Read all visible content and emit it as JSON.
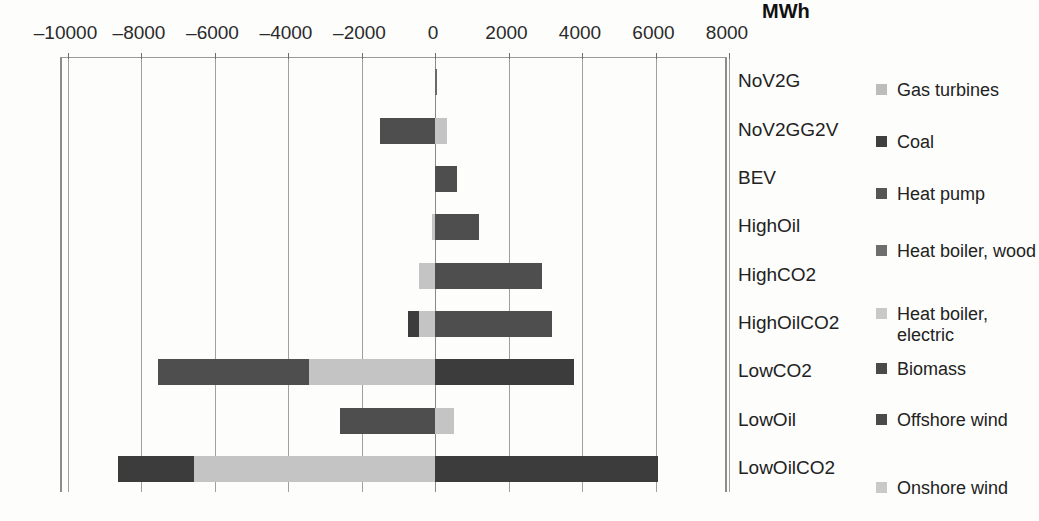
{
  "chart_data": {
    "type": "bar",
    "orientation": "horizontal",
    "stacked": true,
    "title": "",
    "xlabel": "MWh",
    "ylabel": "",
    "unit": "MWh",
    "xlim": [
      -11000,
      9000
    ],
    "xticks": [
      -10000,
      -8000,
      -6000,
      -4000,
      -2000,
      0,
      2000,
      4000,
      6000,
      8000
    ],
    "xtick_labels": [
      "–10000",
      "–8000",
      "–6000",
      "–4000",
      "–2000",
      "0",
      "2000",
      "4000",
      "6000",
      "8000"
    ],
    "grid": true,
    "legend_position": "right",
    "categories": [
      "NoV2G",
      "NoV2GG2V",
      "BEV",
      "HighOil",
      "HighCO2",
      "HighOilCO2",
      "LowCO2",
      "LowOil",
      "LowOilCO2"
    ],
    "series": [
      {
        "name": "Gas turbines",
        "color": "#bdbdbd",
        "values": [
          0,
          0,
          0,
          0,
          0,
          0,
          0,
          0,
          0
        ]
      },
      {
        "name": "Coal",
        "color": "#3f3f3f",
        "values": [
          0,
          0,
          0,
          0,
          0,
          -350,
          0,
          0,
          -2050
        ]
      },
      {
        "name": "Heat pump",
        "color": "#565656",
        "values": [
          0,
          -1500,
          0,
          0,
          0,
          0,
          -4150,
          -2600,
          0
        ]
      },
      {
        "name": "Heat boiler, wood",
        "color": "#6e6e6e",
        "values": [
          0,
          0,
          0,
          0,
          0,
          0,
          0,
          0,
          0
        ]
      },
      {
        "name": "Heat boiler, electric",
        "color": "#c9c9c9",
        "values": [
          0,
          0,
          0,
          0,
          -450,
          -450,
          -3450,
          0,
          -6550
        ]
      },
      {
        "name": "Biomass",
        "color": "#4a4a4a",
        "values": [
          0,
          0,
          0,
          0,
          0,
          0,
          0,
          0,
          0
        ]
      },
      {
        "name": "Offshore wind",
        "color": "#4a4a4a",
        "values": [
          50,
          0,
          600,
          1200,
          2900,
          3200,
          3800,
          0,
          6100
        ]
      },
      {
        "name": "Onshore wind",
        "color": "#c9c9c9",
        "values": [
          0,
          320,
          0,
          0,
          0,
          0,
          0,
          500,
          0
        ]
      }
    ],
    "legend_entries": [
      {
        "label": "Gas turbines",
        "color": "#bdbdbd"
      },
      {
        "label": "Coal",
        "color": "#3f3f3f"
      },
      {
        "label": "Heat pump",
        "color": "#565656"
      },
      {
        "label": "Heat boiler, wood",
        "color": "#6e6e6e"
      },
      {
        "label": "Heat boiler, electric",
        "color": "#c9c9c9"
      },
      {
        "label": "Biomass",
        "color": "#4a4a4a"
      },
      {
        "label": "Offshore wind",
        "color": "#4a4a4a"
      },
      {
        "label": "Onshore wind",
        "color": "#c9c9c9"
      }
    ],
    "bar_segments": [
      {
        "category": "NoV2G",
        "segments": [
          {
            "series": "Offshore wind",
            "from": 0,
            "to": 60,
            "color": "#6a6a6a"
          }
        ]
      },
      {
        "category": "NoV2GG2V",
        "segments": [
          {
            "series": "Heat pump",
            "from": -1500,
            "to": 0,
            "color": "#4e4e4e"
          },
          {
            "series": "Onshore wind",
            "from": 0,
            "to": 330,
            "color": "#c4c4c4"
          }
        ]
      },
      {
        "category": "BEV",
        "segments": [
          {
            "series": "Offshore wind",
            "from": 0,
            "to": 610,
            "color": "#4e4e4e"
          }
        ]
      },
      {
        "category": "HighOil",
        "segments": [
          {
            "series": "Heat boiler, electric",
            "from": -90,
            "to": 0,
            "color": "#c4c4c4"
          },
          {
            "series": "Offshore wind",
            "from": 0,
            "to": 1200,
            "color": "#4e4e4e"
          }
        ]
      },
      {
        "category": "HighCO2",
        "segments": [
          {
            "series": "Heat boiler, electric",
            "from": -440,
            "to": 0,
            "color": "#c4c4c4"
          },
          {
            "series": "Offshore wind",
            "from": 0,
            "to": 2900,
            "color": "#4e4e4e"
          }
        ]
      },
      {
        "category": "HighOilCO2",
        "segments": [
          {
            "series": "Coal",
            "from": -740,
            "to": -440,
            "color": "#3c3c3c"
          },
          {
            "series": "Heat boiler, electric",
            "from": -440,
            "to": 0,
            "color": "#c4c4c4"
          },
          {
            "series": "Offshore wind",
            "from": 0,
            "to": 3180,
            "color": "#4e4e4e"
          }
        ]
      },
      {
        "category": "LowCO2",
        "segments": [
          {
            "series": "Heat pump",
            "from": -7550,
            "to": -3430,
            "color": "#4e4e4e"
          },
          {
            "series": "Heat boiler, electric",
            "from": -3430,
            "to": 0,
            "color": "#c4c4c4"
          },
          {
            "series": "Offshore wind",
            "from": 0,
            "to": 3780,
            "color": "#3c3c3c"
          }
        ]
      },
      {
        "category": "LowOil",
        "segments": [
          {
            "series": "Heat pump",
            "from": -2580,
            "to": 0,
            "color": "#4e4e4e"
          },
          {
            "series": "Onshore wind",
            "from": 0,
            "to": 520,
            "color": "#c4c4c4"
          }
        ]
      },
      {
        "category": "LowOilCO2",
        "segments": [
          {
            "series": "Coal",
            "from": -8620,
            "to": -6550,
            "color": "#3c3c3c"
          },
          {
            "series": "Heat boiler, electric",
            "from": -6550,
            "to": 0,
            "color": "#c4c4c4"
          },
          {
            "series": "Offshore wind",
            "from": 0,
            "to": 6060,
            "color": "#3c3c3c"
          }
        ]
      }
    ]
  }
}
